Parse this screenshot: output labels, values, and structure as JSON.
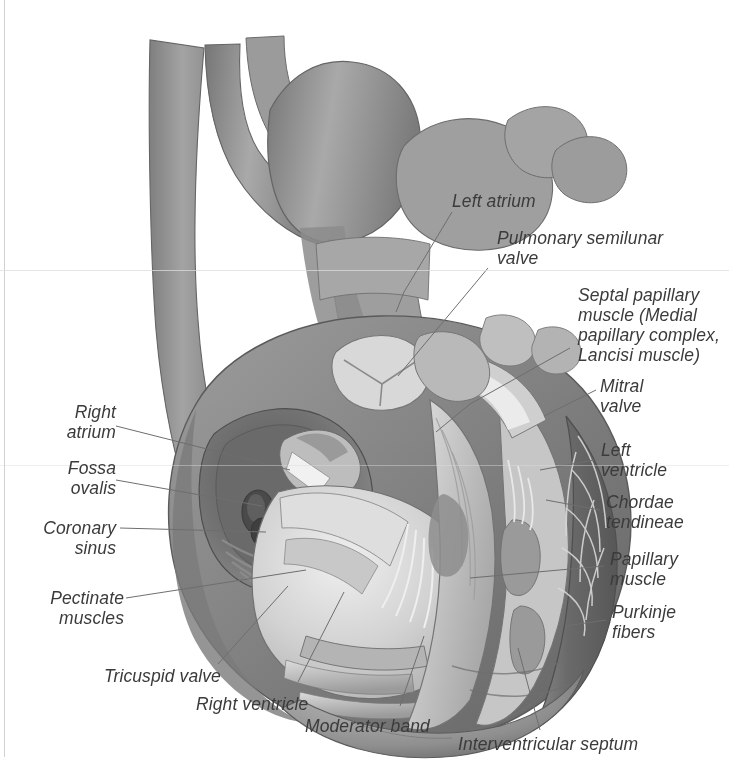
{
  "figure": {
    "style": "grayscale medical illustration",
    "background_color": "#ffffff",
    "label_color": "#3b3b3b",
    "leader_line_color": "#6e6e6e",
    "tissue_colors": {
      "vessel_gray": "#8e8e8e",
      "myocardium_dark": "#6b6b6b",
      "myocardium_mid": "#9a9a9a",
      "endocardium_light": "#cfcfcf",
      "chamber_highlight": "#e6e6e6",
      "shadow": "#4a4a4a",
      "outline": "#555555"
    }
  },
  "labels": [
    {
      "id": "left-atrium",
      "text": "Left atrium"
    },
    {
      "id": "pulmonary-semilunar-valve",
      "text": "Pulmonary semilunar\nvalve"
    },
    {
      "id": "septal-papillary-muscle",
      "text": "Septal papillary\nmuscle (Medial\npapillary complex,\nLancisi muscle)"
    },
    {
      "id": "mitral-valve",
      "text": "Mitral\nvalve"
    },
    {
      "id": "left-ventricle",
      "text": "Left\nventricle"
    },
    {
      "id": "chordae-tendineae",
      "text": "Chordae\ntendineae"
    },
    {
      "id": "papillary-muscle",
      "text": "Papillary\nmuscle"
    },
    {
      "id": "purkinje-fibers",
      "text": "Purkinje\nfibers"
    },
    {
      "id": "right-atrium",
      "text": "Right\natrium"
    },
    {
      "id": "fossa-ovalis",
      "text": "Fossa\novalis"
    },
    {
      "id": "coronary-sinus",
      "text": "Coronary\nsinus"
    },
    {
      "id": "pectinate-muscles",
      "text": "Pectinate\nmuscles"
    },
    {
      "id": "tricuspid-valve",
      "text": "Tricuspid valve"
    },
    {
      "id": "right-ventricle",
      "text": "Right ventricle"
    },
    {
      "id": "moderator-band",
      "text": "Moderator band"
    },
    {
      "id": "interventricular-septum",
      "text": "Interventricular septum"
    }
  ]
}
